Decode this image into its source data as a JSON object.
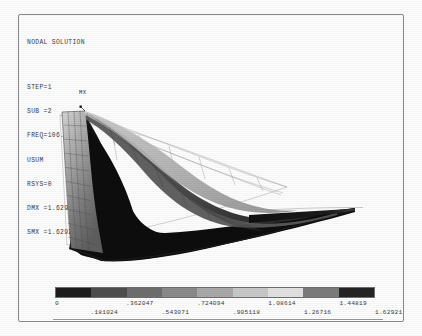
{
  "window": {
    "title": "NODAL SOLUTION"
  },
  "annotation": {
    "title": "NODAL SOLUTION",
    "lines": [
      "STEP=1",
      "SUB =2",
      "FREQ=106.541",
      "USUM     (AVG)",
      "RSYS=0",
      "DMX =1.62921",
      "SMX =1.62921"
    ],
    "step": "STEP=1",
    "sub": "SUB =2",
    "freq": "FREQ=106.541",
    "quantity": "USUM     (AVG)",
    "rsys": "RSYS=0",
    "dmx": "DMX =1.62921",
    "smx": "SMX =1.62921"
  },
  "plot": {
    "max_marker_label": "MX",
    "type": "fea-contour-deformed-shape"
  },
  "chart_data": {
    "type": "heatmap",
    "title": "NODAL SOLUTION",
    "xlabel": "",
    "ylabel": "",
    "colorbar_label": "USUM (AVG)",
    "bands": 9,
    "band_colors": [
      "#1d1d1d",
      "#4e4e4e",
      "#6e6e6e",
      "#8a8a8a",
      "#a9a9a9",
      "#c8c8c8",
      "#e2e2e2",
      "#7b7b7b",
      "#242424"
    ],
    "tick_values": [
      0,
      0.181024,
      0.362047,
      0.543071,
      0.724094,
      0.905118,
      1.08614,
      1.26716,
      1.44819,
      1.62921
    ],
    "tick_labels_top": [
      "0",
      ".362047",
      ".724094",
      "1.08614",
      "1.44819"
    ],
    "tick_labels_bottom": [
      ".181024",
      ".543071",
      ".905118",
      "1.26716",
      "1.62921"
    ],
    "min": 0,
    "max": 1.62921,
    "dmx": 1.62921,
    "smx": 1.62921,
    "frequency_hz": 106.541,
    "step": 1,
    "substep": 2
  },
  "colorbar": {
    "segments": [
      {
        "from": "0",
        "to": ".181024",
        "color": "#1d1d1d"
      },
      {
        "from": ".181024",
        "to": ".362047",
        "color": "#4e4e4e"
      },
      {
        "from": ".362047",
        "to": ".543071",
        "color": "#6e6e6e"
      },
      {
        "from": ".543071",
        "to": ".724094",
        "color": "#8a8a8a"
      },
      {
        "from": ".724094",
        "to": ".905118",
        "color": "#a9a9a9"
      },
      {
        "from": ".905118",
        "to": "1.08614",
        "color": "#c8c8c8"
      },
      {
        "from": "1.08614",
        "to": "1.26716",
        "color": "#e2e2e2"
      },
      {
        "from": "1.26716",
        "to": "1.44819",
        "color": "#7b7b7b"
      },
      {
        "from": "1.44819",
        "to": "1.62921",
        "color": "#242424"
      }
    ],
    "labels_top": [
      "0",
      ".362047",
      ".724094",
      "1.08614",
      "1.44819"
    ],
    "labels_bottom": [
      ".181024",
      ".543071",
      ".905118",
      "1.26716",
      "1.62921"
    ]
  }
}
